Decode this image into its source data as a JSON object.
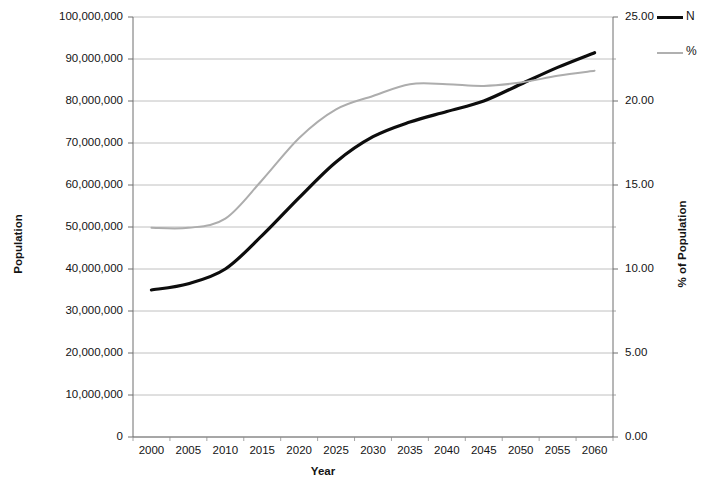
{
  "chart_data": {
    "type": "line",
    "title": "",
    "xlabel": "Year",
    "ylabel": "Population",
    "y2label": "% of Population",
    "grid": true,
    "legend_position": "top-right",
    "x": [
      2000,
      2005,
      2010,
      2015,
      2020,
      2025,
      2030,
      2035,
      2040,
      2045,
      2050,
      2055,
      2060
    ],
    "categories": [
      "2000",
      "2005",
      "2010",
      "2015",
      "2020",
      "2025",
      "2030",
      "2035",
      "2040",
      "2045",
      "2050",
      "2055",
      "2060"
    ],
    "ylim": [
      0,
      100000000
    ],
    "y2lim": [
      0,
      25
    ],
    "yticks": [
      0,
      10000000,
      20000000,
      30000000,
      40000000,
      50000000,
      60000000,
      70000000,
      80000000,
      90000000,
      100000000
    ],
    "ytick_labels": [
      "0",
      "10,000,000",
      "20,000,000",
      "30,000,000",
      "40,000,000",
      "50,000,000",
      "60,000,000",
      "70,000,000",
      "80,000,000",
      "90,000,000",
      "100,000,000"
    ],
    "y2ticks": [
      0,
      5,
      10,
      15,
      20,
      25
    ],
    "y2tick_labels": [
      "0.00",
      "5.00",
      "10.00",
      "15.00",
      "20.00",
      "25.00"
    ],
    "series": [
      {
        "name": "N",
        "axis": "left",
        "color": "#0d0d0d",
        "width": 3.2,
        "values": [
          35000000,
          36500000,
          40000000,
          48000000,
          57000000,
          65500000,
          71500000,
          75000000,
          77500000,
          80000000,
          84000000,
          88000000,
          91500000
        ]
      },
      {
        "name": "%",
        "axis": "right",
        "color": "#adadad",
        "width": 2.0,
        "values": [
          12.45,
          12.45,
          13.0,
          15.3,
          17.8,
          19.5,
          20.3,
          21.0,
          21.0,
          20.9,
          21.1,
          21.5,
          21.8
        ]
      }
    ]
  },
  "legend": {
    "entries": [
      {
        "label": "N",
        "swatch": "series-n"
      },
      {
        "label": "%",
        "swatch": "series-pct"
      }
    ]
  },
  "axes": {
    "x_title": "Year",
    "y_left_title": "Population",
    "y_right_title": "% of Population"
  }
}
